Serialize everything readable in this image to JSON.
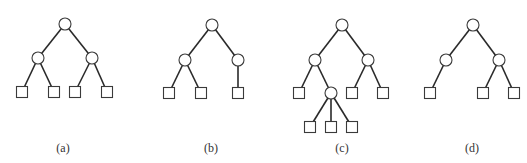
{
  "figure": {
    "node_styles": {
      "internal": "circle",
      "leaf": "square",
      "circle_radius": 6,
      "square_size": 11,
      "stroke_color": "#333333",
      "edge_color": "#2a2a2a",
      "background": "#ffffff"
    },
    "trees": [
      {
        "label": "(a)",
        "label_x": 63,
        "nodes": [
          {
            "id": "a0",
            "type": "circle",
            "x": 65,
            "y": 24
          },
          {
            "id": "a1",
            "type": "circle",
            "x": 38,
            "y": 58
          },
          {
            "id": "a2",
            "type": "circle",
            "x": 92,
            "y": 58
          },
          {
            "id": "a3",
            "type": "square",
            "x": 22,
            "y": 92
          },
          {
            "id": "a4",
            "type": "square",
            "x": 54,
            "y": 92
          },
          {
            "id": "a5",
            "type": "square",
            "x": 75,
            "y": 92
          },
          {
            "id": "a6",
            "type": "square",
            "x": 107,
            "y": 92
          }
        ],
        "edges": [
          [
            "a0",
            "a1"
          ],
          [
            "a0",
            "a2"
          ],
          [
            "a1",
            "a3"
          ],
          [
            "a1",
            "a4"
          ],
          [
            "a2",
            "a5"
          ],
          [
            "a2",
            "a6"
          ]
        ]
      },
      {
        "label": "(b)",
        "label_x": 211,
        "nodes": [
          {
            "id": "b0",
            "type": "circle",
            "x": 212,
            "y": 25
          },
          {
            "id": "b1",
            "type": "circle",
            "x": 185,
            "y": 60
          },
          {
            "id": "b2",
            "type": "circle",
            "x": 238,
            "y": 60
          },
          {
            "id": "b3",
            "type": "square",
            "x": 169,
            "y": 93
          },
          {
            "id": "b4",
            "type": "square",
            "x": 201,
            "y": 93
          },
          {
            "id": "b5",
            "type": "square",
            "x": 238,
            "y": 93
          }
        ],
        "edges": [
          [
            "b0",
            "b1"
          ],
          [
            "b0",
            "b2"
          ],
          [
            "b1",
            "b3"
          ],
          [
            "b1",
            "b4"
          ],
          [
            "b2",
            "b5"
          ]
        ]
      },
      {
        "label": "(c)",
        "label_x": 342,
        "nodes": [
          {
            "id": "c0",
            "type": "circle",
            "x": 342,
            "y": 25
          },
          {
            "id": "c1",
            "type": "circle",
            "x": 315,
            "y": 60
          },
          {
            "id": "c2",
            "type": "circle",
            "x": 368,
            "y": 60
          },
          {
            "id": "c3",
            "type": "square",
            "x": 299,
            "y": 93
          },
          {
            "id": "c4",
            "type": "circle",
            "x": 331,
            "y": 93
          },
          {
            "id": "c5",
            "type": "square",
            "x": 352,
            "y": 93
          },
          {
            "id": "c6",
            "type": "square",
            "x": 383,
            "y": 93
          },
          {
            "id": "c7",
            "type": "square",
            "x": 310,
            "y": 127
          },
          {
            "id": "c8",
            "type": "square",
            "x": 331,
            "y": 127
          },
          {
            "id": "c9",
            "type": "square",
            "x": 352,
            "y": 127
          }
        ],
        "edges": [
          [
            "c0",
            "c1"
          ],
          [
            "c0",
            "c2"
          ],
          [
            "c1",
            "c3"
          ],
          [
            "c1",
            "c4"
          ],
          [
            "c2",
            "c5"
          ],
          [
            "c2",
            "c6"
          ],
          [
            "c4",
            "c7"
          ],
          [
            "c4",
            "c8"
          ],
          [
            "c4",
            "c9"
          ]
        ]
      },
      {
        "label": "(d)",
        "label_x": 472,
        "nodes": [
          {
            "id": "d0",
            "type": "circle",
            "x": 473,
            "y": 25
          },
          {
            "id": "d1",
            "type": "circle",
            "x": 446,
            "y": 60
          },
          {
            "id": "d2",
            "type": "circle",
            "x": 499,
            "y": 60
          },
          {
            "id": "d3",
            "type": "square",
            "x": 430,
            "y": 93
          },
          {
            "id": "d4",
            "type": "square",
            "x": 483,
            "y": 93
          },
          {
            "id": "d5",
            "type": "square",
            "x": 514,
            "y": 93
          }
        ],
        "edges": [
          [
            "d0",
            "d1"
          ],
          [
            "d0",
            "d2"
          ],
          [
            "d1",
            "d3"
          ],
          [
            "d2",
            "d4"
          ],
          [
            "d2",
            "d5"
          ]
        ]
      }
    ]
  }
}
